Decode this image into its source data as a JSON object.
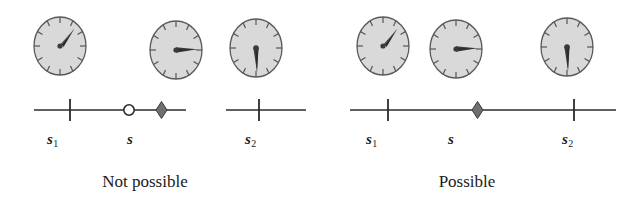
{
  "figure": {
    "type": "physics-diagram",
    "background_color": "#ffffff",
    "ink_color": "#2b2b2b",
    "clock_face_color": "#d8d8d8",
    "clock_rim_color": "#555555",
    "marker_fill_color": "#777777"
  },
  "panels": [
    {
      "id": "not-possible",
      "caption": "Not possible",
      "axis": {
        "broken": true,
        "labels": [
          {
            "key": "s1",
            "base": "s",
            "sub": "1"
          },
          {
            "key": "s",
            "base": "s",
            "sub": ""
          },
          {
            "key": "s2",
            "base": "s",
            "sub": "2"
          }
        ],
        "markers": [
          {
            "name": "tick-s1",
            "kind": "tick",
            "position": 0.18
          },
          {
            "name": "open-circle",
            "kind": "open-circle",
            "position": 0.6
          },
          {
            "name": "diamond-s",
            "kind": "diamond",
            "position": 0.78
          },
          {
            "name": "tick-s2",
            "kind": "tick",
            "position": 1.92
          }
        ]
      },
      "clocks": [
        {
          "name": "clock-s1",
          "reading": "1:30",
          "hand_angle_deg": 45,
          "label": "clock at s1"
        },
        {
          "name": "clock-s",
          "reading": "3:00",
          "hand_angle_deg": 90,
          "label": "clock at s"
        },
        {
          "name": "clock-s2",
          "reading": "6:00",
          "hand_angle_deg": 180,
          "label": "clock at s2"
        }
      ]
    },
    {
      "id": "possible",
      "caption": "Possible",
      "axis": {
        "broken": false,
        "labels": [
          {
            "key": "s1",
            "base": "s",
            "sub": "1"
          },
          {
            "key": "s",
            "base": "s",
            "sub": ""
          },
          {
            "key": "s2",
            "base": "s",
            "sub": "2"
          }
        ],
        "markers": [
          {
            "name": "tick-s1",
            "kind": "tick",
            "position": 0.18
          },
          {
            "name": "diamond-s",
            "kind": "diamond",
            "position": 0.97
          },
          {
            "name": "tick-s2",
            "kind": "tick",
            "position": 1.87
          }
        ]
      },
      "clocks": [
        {
          "name": "clock-s1",
          "reading": "1:30",
          "hand_angle_deg": 45,
          "label": "clock at s1"
        },
        {
          "name": "clock-s",
          "reading": "3:00",
          "hand_angle_deg": 90,
          "label": "clock at s"
        },
        {
          "name": "clock-s2",
          "reading": "6:00",
          "hand_angle_deg": 180,
          "label": "clock at s2"
        }
      ]
    }
  ],
  "clock_geometry": {
    "tick_count": 12,
    "radius_x": 27,
    "radius_y": 30
  }
}
